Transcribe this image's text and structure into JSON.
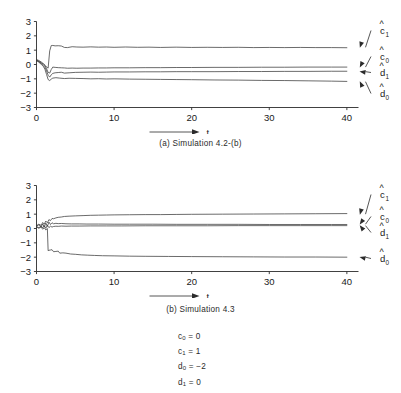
{
  "figure": {
    "background": "#ffffff",
    "ink": "#1a1a1a"
  },
  "panels": [
    {
      "id": "a",
      "caption": "(a)  Simulation 4.2-(b)"
    },
    {
      "id": "b",
      "caption": "(b)  Simulation 4.3"
    }
  ],
  "parameters": [
    {
      "name": "c",
      "sub": "0",
      "eq": "=",
      "value": "0",
      "text": "c0 = 0"
    },
    {
      "name": "c",
      "sub": "1",
      "eq": "=",
      "value": "1",
      "text": "c1 = 1"
    },
    {
      "name": "d",
      "sub": "0",
      "eq": "=",
      "value": "−2",
      "text": "d0 = −2"
    },
    {
      "name": "d",
      "sub": "1",
      "eq": "=",
      "value": "0",
      "text": "d1 = 0"
    }
  ],
  "chart_data": [
    {
      "type": "line",
      "title": "(a)  Simulation 4.2-(b)",
      "xlabel": "t",
      "ylabel": "",
      "xlim": [
        0,
        41.5
      ],
      "ylim": [
        -3,
        3
      ],
      "xticks": [
        0,
        10,
        20,
        30,
        40
      ],
      "xticklabels": [
        "0",
        "10",
        "20",
        "30",
        "40"
      ],
      "yticks": [
        -3,
        -2,
        -1,
        0,
        1,
        2,
        3
      ],
      "yticklabels": [
        "−3",
        "−2",
        "−1",
        "0",
        "1",
        "2",
        "3"
      ],
      "grid": false,
      "legend": "right-annotations",
      "series": [
        {
          "name": "c1hat",
          "label": "c",
          "label_sub": "1",
          "hat": true,
          "steady_value": 1.2,
          "x": [
            0,
            0.3,
            0.6,
            0.9,
            1.1,
            1.3,
            1.5,
            1.7,
            1.9,
            2.1,
            2.4,
            2.8,
            3.2,
            3.6,
            4.0,
            4.6,
            5.2,
            6.0,
            7.0,
            8.0,
            9.0,
            10.0,
            11.5,
            13.0,
            14.5,
            16.0,
            18.0,
            20.0,
            22.0,
            24.0,
            26.0,
            28.0,
            30.0,
            32.0,
            34.0,
            36.0,
            38.0,
            40.0
          ],
          "y": [
            0.35,
            0.28,
            0.18,
            0.05,
            -0.05,
            -0.18,
            -0.25,
            0.95,
            1.32,
            1.33,
            1.3,
            1.31,
            1.29,
            1.19,
            1.18,
            1.24,
            1.22,
            1.21,
            1.23,
            1.21,
            1.22,
            1.2,
            1.22,
            1.2,
            1.21,
            1.19,
            1.21,
            1.19,
            1.2,
            1.19,
            1.2,
            1.18,
            1.19,
            1.18,
            1.19,
            1.18,
            1.18,
            1.17
          ]
        },
        {
          "name": "c0hat",
          "label": "c",
          "label_sub": "0",
          "hat": true,
          "steady_value": -0.18,
          "x": [
            0,
            0.3,
            0.6,
            0.9,
            1.1,
            1.3,
            1.5,
            1.7,
            1.9,
            2.1,
            2.4,
            2.8,
            3.2,
            3.6,
            4.0,
            4.6,
            5.2,
            6.0,
            7.0,
            8.0,
            9.0,
            10.0,
            12.0,
            14.0,
            16.0,
            18.0,
            20.0,
            23.0,
            26.0,
            29.0,
            32.0,
            35.0,
            38.0,
            40.0
          ],
          "y": [
            0.3,
            0.22,
            0.12,
            0.02,
            -0.08,
            -0.3,
            -0.55,
            -0.6,
            -0.35,
            -0.18,
            -0.2,
            -0.22,
            -0.23,
            -0.24,
            -0.26,
            -0.25,
            -0.26,
            -0.25,
            -0.25,
            -0.24,
            -0.24,
            -0.23,
            -0.23,
            -0.22,
            -0.22,
            -0.21,
            -0.21,
            -0.2,
            -0.2,
            -0.19,
            -0.19,
            -0.18,
            -0.18,
            -0.18
          ]
        },
        {
          "name": "d1hat",
          "label": "d",
          "label_sub": "1",
          "hat": true,
          "steady_value": -0.5,
          "x": [
            0,
            0.3,
            0.6,
            0.9,
            1.1,
            1.3,
            1.5,
            1.7,
            1.9,
            2.1,
            2.4,
            2.8,
            3.2,
            3.6,
            4.2,
            5.0,
            6.0,
            7.0,
            8.0,
            9.0,
            10.0,
            12.0,
            14.0,
            16.0,
            18.0,
            20.0,
            23.0,
            26.0,
            29.0,
            32.0,
            35.0,
            38.0,
            40.0
          ],
          "y": [
            0.3,
            0.2,
            0.08,
            -0.08,
            -0.22,
            -0.45,
            -0.75,
            -0.88,
            -0.72,
            -0.62,
            -0.58,
            -0.56,
            -0.54,
            -0.6,
            -0.58,
            -0.55,
            -0.54,
            -0.53,
            -0.54,
            -0.53,
            -0.52,
            -0.52,
            -0.51,
            -0.51,
            -0.5,
            -0.5,
            -0.5,
            -0.49,
            -0.49,
            -0.48,
            -0.48,
            -0.47,
            -0.47
          ]
        },
        {
          "name": "d0hat",
          "label": "d",
          "label_sub": "0",
          "hat": true,
          "steady_value": -1.2,
          "x": [
            0,
            0.3,
            0.6,
            0.9,
            1.1,
            1.3,
            1.5,
            1.7,
            1.9,
            2.1,
            2.5,
            3.0,
            3.6,
            4.2,
            5.0,
            6.0,
            7.0,
            8.0,
            9.0,
            10.0,
            12.0,
            14.0,
            16.0,
            18.0,
            20.0,
            23.0,
            26.0,
            29.0,
            32.0,
            35.0,
            38.0,
            40.0
          ],
          "y": [
            0.28,
            0.16,
            0.02,
            -0.15,
            -0.35,
            -0.7,
            -1.05,
            -1.12,
            -1.02,
            -0.95,
            -0.92,
            -0.95,
            -0.98,
            -0.96,
            -0.97,
            -0.98,
            -1.0,
            -0.99,
            -1.01,
            -1.0,
            -1.02,
            -1.03,
            -1.04,
            -1.05,
            -1.06,
            -1.08,
            -1.09,
            -1.11,
            -1.12,
            -1.14,
            -1.16,
            -1.18
          ]
        }
      ]
    },
    {
      "type": "line",
      "title": "(b)  Simulation 4.3",
      "xlabel": "t",
      "ylabel": "",
      "xlim": [
        0,
        41.5
      ],
      "ylim": [
        -3,
        3
      ],
      "xticks": [
        0,
        10,
        20,
        30,
        40
      ],
      "xticklabels": [
        "0",
        "10",
        "20",
        "30",
        "40"
      ],
      "yticks": [
        -3,
        -2,
        -1,
        0,
        1,
        2,
        3
      ],
      "yticklabels": [
        "−3",
        "−2",
        "−1",
        "0",
        "1",
        "2",
        "3"
      ],
      "grid": false,
      "legend": "right-annotations",
      "series": [
        {
          "name": "c1hat",
          "label": "c",
          "label_sub": "1",
          "hat": true,
          "steady_value": 1.0,
          "x": [
            0,
            0.3,
            0.6,
            0.8,
            1.0,
            1.2,
            1.4,
            1.6,
            1.8,
            2.0,
            2.2,
            2.5,
            2.8,
            3.2,
            3.6,
            4.2,
            5.0,
            6.0,
            7.0,
            8.0,
            9.0,
            10.0,
            12.0,
            14.0,
            16.0,
            18.0,
            20.0,
            24.0,
            28.0,
            32.0,
            36.0,
            40.0
          ],
          "y": [
            0.2,
            0.3,
            0.22,
            0.42,
            0.3,
            0.52,
            0.4,
            0.62,
            0.55,
            0.7,
            0.68,
            0.74,
            0.78,
            0.8,
            0.84,
            0.86,
            0.88,
            0.9,
            0.92,
            0.93,
            0.94,
            0.95,
            0.96,
            0.97,
            0.97,
            0.98,
            0.99,
            1.0,
            1.01,
            1.02,
            1.03,
            1.04
          ]
        },
        {
          "name": "c0hat",
          "label": "c",
          "label_sub": "0",
          "hat": true,
          "steady_value": 0.3,
          "x": [
            0,
            0.3,
            0.6,
            0.8,
            1.0,
            1.2,
            1.4,
            1.6,
            1.8,
            2.0,
            2.2,
            2.5,
            2.8,
            3.2,
            3.8,
            4.5,
            5.5,
            6.5,
            8.0,
            10.0,
            12.0,
            15.0,
            18.0,
            22.0,
            26.0,
            30.0,
            34.0,
            38.0,
            40.0
          ],
          "y": [
            0.18,
            0.25,
            0.12,
            0.32,
            0.1,
            0.38,
            0.15,
            0.45,
            0.28,
            0.4,
            0.33,
            0.36,
            0.34,
            0.35,
            0.33,
            0.32,
            0.32,
            0.31,
            0.31,
            0.3,
            0.3,
            0.3,
            0.29,
            0.29,
            0.29,
            0.28,
            0.28,
            0.28,
            0.28
          ]
        },
        {
          "name": "d1hat",
          "label": "d",
          "label_sub": "1",
          "hat": true,
          "steady_value": 0.2,
          "x": [
            0,
            0.3,
            0.6,
            0.8,
            1.0,
            1.2,
            1.4,
            1.6,
            1.8,
            2.0,
            2.2,
            2.5,
            2.8,
            3.2,
            3.8,
            4.5,
            5.5,
            7.0,
            9.0,
            11.0,
            14.0,
            18.0,
            22.0,
            26.0,
            30.0,
            34.0,
            38.0,
            40.0
          ],
          "y": [
            0.15,
            0.05,
            0.18,
            0.04,
            0.2,
            0.02,
            0.22,
            0.06,
            0.16,
            0.1,
            0.14,
            0.16,
            0.15,
            0.17,
            0.16,
            0.17,
            0.17,
            0.18,
            0.18,
            0.18,
            0.19,
            0.19,
            0.19,
            0.2,
            0.2,
            0.2,
            0.2,
            0.2
          ]
        },
        {
          "name": "d0hat",
          "label": "d",
          "label_sub": "0",
          "hat": true,
          "steady_value": -2.0,
          "x": [
            0,
            0.3,
            0.6,
            0.8,
            1.0,
            1.2,
            1.4,
            1.5,
            1.6,
            1.8,
            2.0,
            2.2,
            2.5,
            2.8,
            3.0,
            3.4,
            3.8,
            4.4,
            5.0,
            5.8,
            6.6,
            7.5,
            8.5,
            10.0,
            12.0,
            14.0,
            17.0,
            20.0,
            24.0,
            28.0,
            32.0,
            36.0,
            40.0
          ],
          "y": [
            0.12,
            0.02,
            0.1,
            -0.05,
            0.05,
            -0.1,
            0.0,
            -1.55,
            -1.52,
            -1.5,
            -1.48,
            -1.62,
            -1.6,
            -1.58,
            -1.72,
            -1.7,
            -1.72,
            -1.78,
            -1.8,
            -1.84,
            -1.86,
            -1.88,
            -1.9,
            -1.91,
            -1.93,
            -1.94,
            -1.95,
            -1.96,
            -1.97,
            -1.98,
            -1.99,
            -1.99,
            -2.0
          ]
        }
      ]
    }
  ]
}
